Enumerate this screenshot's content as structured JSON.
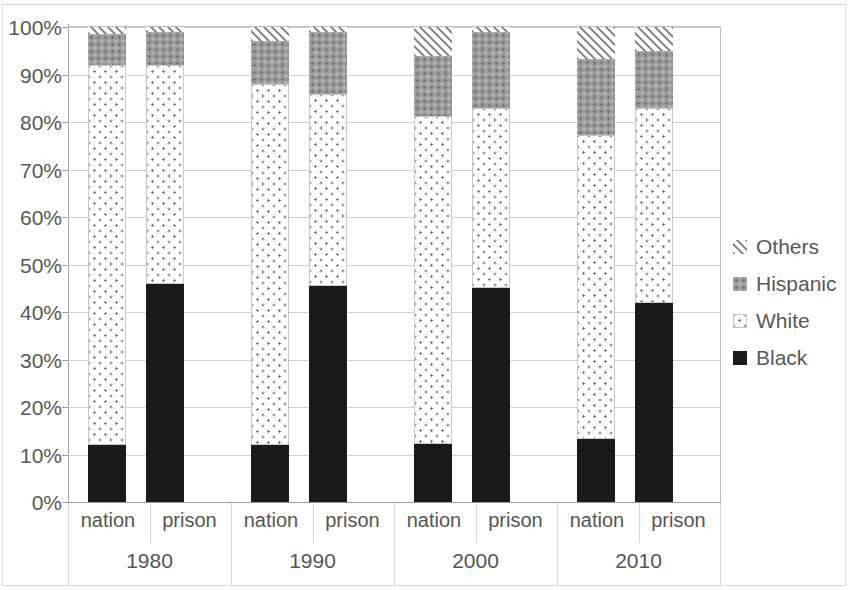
{
  "chart_data": {
    "type": "bar",
    "subtype": "stacked-100-percent",
    "title": "",
    "xlabel": "",
    "ylabel": "",
    "ylim": [
      0,
      100
    ],
    "ytick_labels": [
      "0%",
      "10%",
      "20%",
      "30%",
      "40%",
      "50%",
      "60%",
      "70%",
      "80%",
      "90%",
      "100%"
    ],
    "ytick_values": [
      0,
      10,
      20,
      30,
      40,
      50,
      60,
      70,
      80,
      90,
      100
    ],
    "grid": true,
    "legend_position": "right",
    "groups": [
      "1980",
      "1990",
      "2000",
      "2010"
    ],
    "categories": [
      "nation",
      "prison",
      "nation",
      "prison",
      "nation",
      "prison",
      "nation",
      "prison"
    ],
    "series": [
      {
        "name": "Black",
        "color": "#1a1a1a",
        "pattern": "solid",
        "values": [
          12.0,
          46.0,
          12.0,
          45.5,
          12.3,
          45.0,
          13.2,
          42.0
        ]
      },
      {
        "name": "White",
        "color": "#ffffff",
        "pattern": "light-dots",
        "values": [
          80.0,
          46.0,
          76.0,
          40.5,
          69.0,
          38.0,
          64.0,
          41.0
        ]
      },
      {
        "name": "Hispanic",
        "color": "#9b9b9b",
        "pattern": "gray-texture",
        "values": [
          6.5,
          7.0,
          9.0,
          13.0,
          12.5,
          16.0,
          16.0,
          12.0
        ]
      },
      {
        "name": "Others",
        "color": "#8e8e8e",
        "pattern": "diagonal-hatch",
        "values": [
          1.5,
          1.0,
          3.0,
          1.0,
          6.2,
          1.0,
          6.8,
          5.0
        ]
      }
    ],
    "bars": [
      {
        "group": "1980",
        "category": "nation",
        "Black": 12.0,
        "White": 80.0,
        "Hispanic": 6.5,
        "Others": 1.5
      },
      {
        "group": "1980",
        "category": "prison",
        "Black": 46.0,
        "White": 46.0,
        "Hispanic": 7.0,
        "Others": 1.0
      },
      {
        "group": "1990",
        "category": "nation",
        "Black": 12.0,
        "White": 76.0,
        "Hispanic": 9.0,
        "Others": 3.0
      },
      {
        "group": "1990",
        "category": "prison",
        "Black": 45.5,
        "White": 40.5,
        "Hispanic": 13.0,
        "Others": 1.0
      },
      {
        "group": "2000",
        "category": "nation",
        "Black": 12.3,
        "White": 69.0,
        "Hispanic": 12.5,
        "Others": 6.2
      },
      {
        "group": "2000",
        "category": "prison",
        "Black": 45.0,
        "White": 38.0,
        "Hispanic": 16.0,
        "Others": 1.0
      },
      {
        "group": "2010",
        "category": "nation",
        "Black": 13.2,
        "White": 64.0,
        "Hispanic": 16.0,
        "Others": 6.8
      },
      {
        "group": "2010",
        "category": "prison",
        "Black": 42.0,
        "White": 41.0,
        "Hispanic": 12.0,
        "Others": 5.0
      }
    ]
  },
  "legend": {
    "items": [
      {
        "label": "Others",
        "swatch": "diagonal-hatch-swatch"
      },
      {
        "label": "Hispanic",
        "swatch": "gray-texture-swatch"
      },
      {
        "label": "White",
        "swatch": "light-dots-swatch"
      },
      {
        "label": "Black",
        "swatch": "solid-black-swatch"
      }
    ]
  },
  "axes": {
    "y": {
      "labels": [
        "100%",
        "90%",
        "80%",
        "70%",
        "60%",
        "50%",
        "40%",
        "30%",
        "20%",
        "10%",
        "0%"
      ]
    },
    "x": {
      "category_labels": [
        "nation",
        "prison",
        "nation",
        "prison",
        "nation",
        "prison",
        "nation",
        "prison"
      ],
      "group_labels": [
        "1980",
        "1990",
        "2000",
        "2010"
      ]
    }
  },
  "colors": {
    "black_series": "#1a1a1a",
    "hispanic_series": "#9b9b9b",
    "others_hatch": "#8e8e8e",
    "white_dots": "#7d7d7d",
    "gridline": "#d0d0d0",
    "axis": "#9b9b9b",
    "text": "#585858"
  }
}
